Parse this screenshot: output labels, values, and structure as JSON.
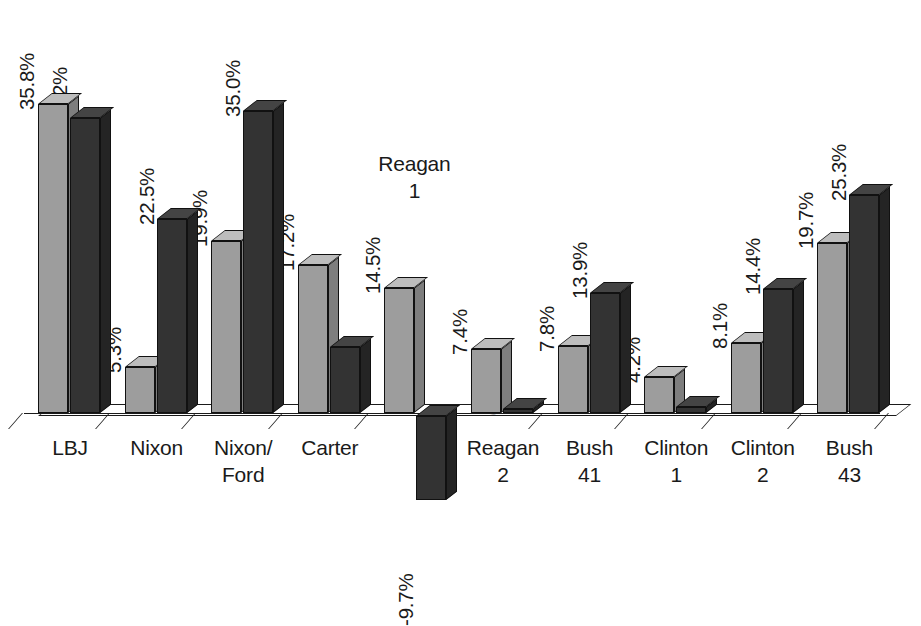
{
  "chart_data": {
    "type": "bar",
    "title": "",
    "subtitle": "",
    "xlabel": "",
    "ylabel": "",
    "grid": false,
    "legend_position": "none",
    "ylim": [
      -12,
      40
    ],
    "value_suffix": "%",
    "categories": [
      "LBJ",
      "Nixon",
      "Nixon/\nFord",
      "Carter",
      "Reagan\n1",
      "Reagan\n2",
      "Bush\n41",
      "Clinton\n1",
      "Clinton\n2",
      "Bush\n43"
    ],
    "series": [
      {
        "name": "series-1",
        "color": "#9d9d9d",
        "values": [
          35.8,
          5.3,
          19.9,
          17.2,
          14.5,
          7.4,
          7.8,
          4.2,
          8.1,
          19.7
        ],
        "labels": [
          "35.8%",
          "5.3%",
          "19.9%",
          "17.2%",
          "14.5%",
          "7.4%",
          "7.8%",
          "4.2%",
          "8.1%",
          "19.7%"
        ]
      },
      {
        "name": "series-2",
        "color": "#333333",
        "values": [
          34.2,
          22.5,
          35.0,
          7.6,
          -9.7,
          0.2,
          13.9,
          0.7,
          14.4,
          25.3
        ],
        "labels": [
          "34.2%",
          "22.5%",
          "35.0%",
          "7.6%",
          "-9.7%",
          "0.2%",
          "13.9%",
          "0.7%",
          "14.4%",
          "25.3%"
        ]
      }
    ]
  }
}
